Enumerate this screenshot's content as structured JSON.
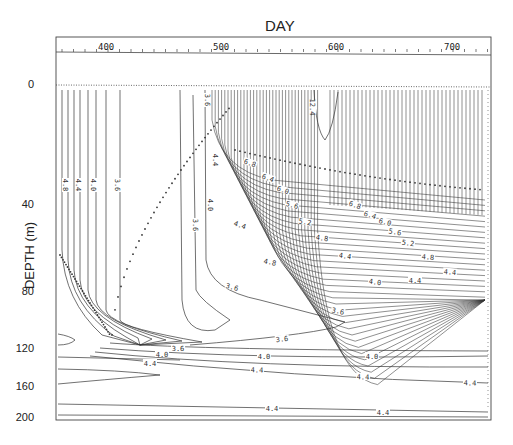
{
  "chart_data": {
    "type": "contour",
    "title": "DAY",
    "xlabel": "DAY",
    "ylabel": "DEPTH (m)",
    "x_ticks": [
      "400",
      "500",
      "600",
      "700"
    ],
    "y_ticks": [
      "0",
      "40",
      "80",
      "120",
      "160",
      "200"
    ],
    "xlim": [
      365,
      730
    ],
    "ylim": [
      200,
      0
    ],
    "contour_levels": [
      3.6,
      4.0,
      4.4,
      4.8,
      5.2,
      5.6,
      6.0,
      6.4,
      6.8,
      12.4
    ],
    "visible_labels": [
      "3.6",
      "4.0",
      "4.4",
      "4.8",
      "5.2",
      "5.6",
      "6.0",
      "6.4",
      "6.8",
      "12.4"
    ],
    "annotations": [
      "dotted line marks mixed-layer depth, deepening to ~115 m near day 420 and shoaling to ~35 m by day 600"
    ],
    "grid": false
  },
  "axes": {
    "title": "DAY",
    "ylabel": "DEPTH (m)",
    "x_ticks": [
      {
        "label": "400",
        "x": 106
      },
      {
        "label": "500",
        "x": 221
      },
      {
        "label": "600",
        "x": 336
      },
      {
        "label": "700",
        "x": 452
      }
    ],
    "y_ticks": [
      {
        "label": "0",
        "y": 85
      },
      {
        "label": "40",
        "y": 205
      },
      {
        "label": "80",
        "y": 292
      },
      {
        "label": "120",
        "y": 349
      },
      {
        "label": "160",
        "y": 387
      },
      {
        "label": "200",
        "y": 418
      }
    ]
  },
  "labels": [
    {
      "t": "3.6",
      "x": 207,
      "y": 100,
      "r": 90
    },
    {
      "t": "4.8",
      "x": 65,
      "y": 185,
      "r": 90
    },
    {
      "t": "4.4",
      "x": 78,
      "y": 185,
      "r": 90
    },
    {
      "t": "4.0",
      "x": 93,
      "y": 185,
      "r": 90
    },
    {
      "t": "3.6",
      "x": 117,
      "y": 185,
      "r": 90
    },
    {
      "t": "4.4",
      "x": 215,
      "y": 160,
      "r": 90
    },
    {
      "t": "3.6",
      "x": 195,
      "y": 225,
      "r": 90
    },
    {
      "t": "4.0",
      "x": 210,
      "y": 205,
      "r": 90
    },
    {
      "t": "6.8",
      "x": 250,
      "y": 163,
      "r": 20
    },
    {
      "t": "6.4",
      "x": 268,
      "y": 178,
      "r": 20
    },
    {
      "t": "6.0",
      "x": 283,
      "y": 190,
      "r": 20
    },
    {
      "t": "5.6",
      "x": 292,
      "y": 205,
      "r": 15
    },
    {
      "t": "5.2",
      "x": 305,
      "y": 222,
      "r": 10
    },
    {
      "t": "4.8",
      "x": 322,
      "y": 238,
      "r": 8
    },
    {
      "t": "4.4",
      "x": 240,
      "y": 225,
      "r": 20
    },
    {
      "t": "6.8",
      "x": 355,
      "y": 205,
      "r": 20
    },
    {
      "t": "6.4",
      "x": 370,
      "y": 215,
      "r": 18
    },
    {
      "t": "6.0",
      "x": 385,
      "y": 222,
      "r": 15
    },
    {
      "t": "5.6",
      "x": 395,
      "y": 232,
      "r": 10
    },
    {
      "t": "5.2",
      "x": 408,
      "y": 243,
      "r": 8
    },
    {
      "t": "4.8",
      "x": 428,
      "y": 257,
      "r": 5
    },
    {
      "t": "4.4",
      "x": 450,
      "y": 272,
      "r": 5
    },
    {
      "t": "4.8",
      "x": 270,
      "y": 262,
      "r": 12
    },
    {
      "t": "4.0",
      "x": 375,
      "y": 282,
      "r": 8
    },
    {
      "t": "4.4",
      "x": 345,
      "y": 256,
      "r": 8
    },
    {
      "t": "3.6",
      "x": 232,
      "y": 287,
      "r": 15
    },
    {
      "t": "3.6",
      "x": 338,
      "y": 311,
      "r": 12
    },
    {
      "t": "3.6",
      "x": 282,
      "y": 339,
      "r": -6
    },
    {
      "t": "3.6",
      "x": 178,
      "y": 348,
      "r": 0
    },
    {
      "t": "4.0",
      "x": 162,
      "y": 354,
      "r": 0
    },
    {
      "t": "4.0",
      "x": 264,
      "y": 356,
      "r": 0
    },
    {
      "t": "4.0",
      "x": 372,
      "y": 356,
      "r": 0
    },
    {
      "t": "4.4",
      "x": 150,
      "y": 363,
      "r": 0
    },
    {
      "t": "4.4",
      "x": 257,
      "y": 370,
      "r": 2
    },
    {
      "t": "4.4",
      "x": 363,
      "y": 377,
      "r": 2
    },
    {
      "t": "4.4",
      "x": 470,
      "y": 383,
      "r": 2
    },
    {
      "t": "4.4",
      "x": 272,
      "y": 408,
      "r": 0
    },
    {
      "t": "4.4",
      "x": 383,
      "y": 412,
      "r": 0
    },
    {
      "t": "12.4",
      "x": 312,
      "y": 107,
      "r": 90
    },
    {
      "t": "4.4",
      "x": 415,
      "y": 280,
      "r": 0
    }
  ]
}
